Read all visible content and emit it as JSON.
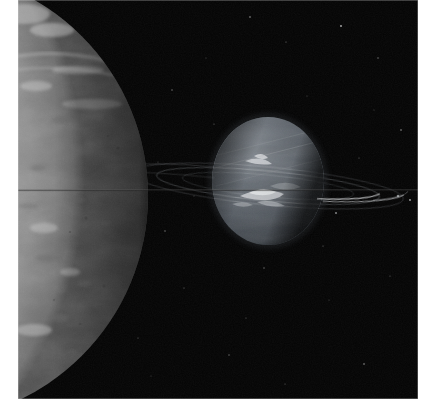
{
  "image": {
    "kind": "astronomical-photograph",
    "palette": "greyscale",
    "width": 426,
    "height": 411,
    "background_color": "#ffffff",
    "sky_color": "#050505"
  },
  "plate": {
    "x": 18,
    "y": 0,
    "width": 400,
    "height": 399,
    "border_color": "#d8d8d8"
  },
  "foreground_moon": {
    "name": "cratered-moon-limb",
    "description": "Large icy moon filling the left edge, only its right limb visible, mottled grey terrain with dark patches and bright ridges",
    "center_x": -96,
    "center_y": 196,
    "radius": 226,
    "surface_color": "#a9a9a9",
    "highlight_color": "#d2d2d2",
    "shadow_color": "#6e6e6e",
    "limb_x": 130
  },
  "planet": {
    "name": "banded-gas-giant",
    "description": "Blue-grey gas giant with latitudinal cloud bands and bright wispy cloud streaks near the equator",
    "center_x": 250,
    "center_y": 181,
    "radius_x": 56,
    "radius_y": 64,
    "body_color": "#5a6068",
    "terminator_color": "#0a0c0e",
    "band_color": "#70777f",
    "bright_cloud_color": "#e8eaec"
  },
  "rings": {
    "name": "planetary-ring-system",
    "description": "Thin ring arcs crossing the field nearly edge-on, brightest in two arcs to the right of the planet",
    "tilt_degrees": 6,
    "color": "#b8bcc0",
    "arcs": [
      {
        "label": "outer-ring-right-arc",
        "cx": 250,
        "cy": 186,
        "rx": 112,
        "ry": 15
      },
      {
        "label": "inner-ring-right-arc",
        "cx": 250,
        "cy": 186,
        "rx": 86,
        "ry": 11
      },
      {
        "label": "ansa-far-right",
        "cx": 250,
        "cy": 186,
        "rx": 136,
        "ry": 19
      }
    ]
  },
  "scanline": {
    "name": "horizontal-scan-artifact",
    "y": 190,
    "color": "#3a3a3a",
    "description": "Faint horizontal instrument scan line crossing the whole frame"
  },
  "stars": {
    "name": "background-starfield",
    "count": 26,
    "color": "#cfcfcf",
    "points": [
      {
        "x": 232,
        "y": 17,
        "r": 0.8
      },
      {
        "x": 268,
        "y": 42,
        "r": 0.6
      },
      {
        "x": 154,
        "y": 90,
        "r": 0.7
      },
      {
        "x": 323,
        "y": 26,
        "r": 0.9
      },
      {
        "x": 360,
        "y": 58,
        "r": 0.7
      },
      {
        "x": 196,
        "y": 124,
        "r": 0.6
      },
      {
        "x": 383,
        "y": 130,
        "r": 0.8
      },
      {
        "x": 147,
        "y": 231,
        "r": 0.7
      },
      {
        "x": 166,
        "y": 288,
        "r": 0.6
      },
      {
        "x": 246,
        "y": 268,
        "r": 0.7
      },
      {
        "x": 305,
        "y": 246,
        "r": 0.6
      },
      {
        "x": 346,
        "y": 364,
        "r": 0.8
      },
      {
        "x": 120,
        "y": 338,
        "r": 0.6
      },
      {
        "x": 211,
        "y": 355,
        "r": 0.7
      },
      {
        "x": 392,
        "y": 200,
        "r": 0.9
      },
      {
        "x": 140,
        "y": 162,
        "r": 0.5
      },
      {
        "x": 289,
        "y": 96,
        "r": 0.5
      },
      {
        "x": 341,
        "y": 158,
        "r": 0.6
      },
      {
        "x": 176,
        "y": 196,
        "r": 0.5
      },
      {
        "x": 228,
        "y": 318,
        "r": 0.6
      },
      {
        "x": 311,
        "y": 300,
        "r": 0.5
      },
      {
        "x": 372,
        "y": 276,
        "r": 0.6
      },
      {
        "x": 133,
        "y": 376,
        "r": 0.5
      },
      {
        "x": 267,
        "y": 384,
        "r": 0.6
      },
      {
        "x": 356,
        "y": 110,
        "r": 0.5
      },
      {
        "x": 188,
        "y": 58,
        "r": 0.5
      }
    ]
  },
  "moon_features": {
    "name": "surface-markings",
    "dark_patches": [
      {
        "x": 44,
        "y": 120,
        "rx": 11,
        "ry": 4
      },
      {
        "x": 72,
        "y": 144,
        "rx": 6,
        "ry": 3
      },
      {
        "x": 96,
        "y": 158,
        "rx": 5,
        "ry": 2
      },
      {
        "x": 58,
        "y": 200,
        "rx": 9,
        "ry": 3
      },
      {
        "x": 88,
        "y": 224,
        "rx": 4,
        "ry": 2
      },
      {
        "x": 30,
        "y": 258,
        "rx": 12,
        "ry": 4
      },
      {
        "x": 66,
        "y": 284,
        "rx": 7,
        "ry": 3
      },
      {
        "x": 42,
        "y": 318,
        "rx": 9,
        "ry": 4
      },
      {
        "x": 80,
        "y": 348,
        "rx": 6,
        "ry": 3
      },
      {
        "x": 20,
        "y": 168,
        "rx": 8,
        "ry": 3
      }
    ],
    "bright_ridges": [
      {
        "x": 34,
        "y": 30,
        "rx": 22,
        "ry": 7
      },
      {
        "x": 18,
        "y": 86,
        "rx": 16,
        "ry": 5
      },
      {
        "x": 60,
        "y": 70,
        "rx": 26,
        "ry": 4
      },
      {
        "x": 26,
        "y": 228,
        "rx": 14,
        "ry": 5
      },
      {
        "x": 52,
        "y": 272,
        "rx": 10,
        "ry": 4
      },
      {
        "x": 16,
        "y": 330,
        "rx": 18,
        "ry": 6
      }
    ]
  }
}
